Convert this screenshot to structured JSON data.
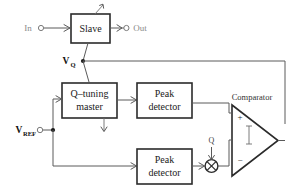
{
  "figure": {
    "background_color": "#ffffff",
    "line_color": "#5a5a5a",
    "block_border_color": "#2b2b2b"
  },
  "blocks": {
    "slave": {
      "line1": "Slave"
    },
    "q_tuning_master": {
      "line1": "Q–tuning",
      "line2": "master"
    },
    "peak_detector_top": {
      "line1": "Peak",
      "line2": "detector"
    },
    "peak_detector_bottom": {
      "line1": "Peak",
      "line2": "detector"
    },
    "comparator": {
      "label": "Comparator",
      "plus": "+",
      "minus": "−"
    },
    "multiplier": {
      "icon": "multiply-icon"
    }
  },
  "ports": {
    "input": {
      "label": "In",
      "terminal": "open-circle-terminal"
    },
    "output": {
      "label": "Out",
      "terminal": "open-circle-terminal"
    },
    "vref": {
      "label": "V",
      "subscript": "REF",
      "terminal": "open-circle-terminal"
    }
  },
  "signals": {
    "vq": {
      "label": "V",
      "subscript": "Q"
    },
    "q_gain": {
      "label": "Q"
    }
  },
  "icons": {
    "tuning_arrow_slave": "diagonal-tuning-arrow-icon",
    "tuning_arrow_master": "down-tuning-arrow-icon",
    "multiply": "multiply-icon"
  }
}
